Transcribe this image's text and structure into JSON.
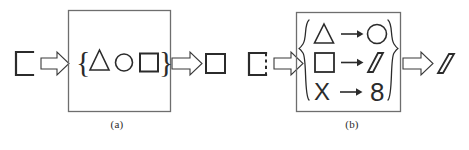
{
  "figure": {
    "title": "",
    "background_color": "#ffffff",
    "stroke_color": "#3a3a3a",
    "box_stroke_color": "#6e6e6e",
    "panels": [
      {
        "id": "a",
        "caption": "(a)",
        "input": {
          "shape_name": "open-square",
          "description": "square with open (missing) right side"
        },
        "arrow_in": {
          "name": "block-arrow-right",
          "direction": "right"
        },
        "process_box": {
          "notation": "set",
          "open_brace": "{",
          "close_brace": "}",
          "members": [
            {
              "shape_name": "triangle",
              "symbol": "△"
            },
            {
              "shape_name": "circle",
              "symbol": "○"
            },
            {
              "shape_name": "square",
              "symbol": "□"
            }
          ]
        },
        "arrow_out": {
          "name": "block-arrow-right",
          "direction": "right"
        },
        "output": {
          "shape_name": "square",
          "description": "closed square"
        }
      },
      {
        "id": "b",
        "caption": "(b)",
        "input": {
          "shape_name": "dashed-right-square",
          "description": "square with dashed right side"
        },
        "arrow_in": {
          "name": "block-arrow-right",
          "direction": "right"
        },
        "process_box": {
          "notation": "mapping-set",
          "open_brace": "{",
          "close_brace": "}",
          "rules": [
            {
              "from_shape": "triangle",
              "from_symbol": "△",
              "arrow": "→",
              "to_shape": "circle",
              "to_symbol": "○"
            },
            {
              "from_shape": "square",
              "from_symbol": "□",
              "arrow": "→",
              "to_shape": "parallelogram",
              "to_symbol": "▱"
            },
            {
              "from_shape": "letter-x",
              "from_symbol": "X",
              "arrow": "→",
              "to_shape": "digit-eight",
              "to_symbol": "8"
            }
          ]
        },
        "arrow_out": {
          "name": "block-arrow-right",
          "direction": "right"
        },
        "output": {
          "shape_name": "parallelogram",
          "description": "parallelogram"
        }
      }
    ]
  }
}
